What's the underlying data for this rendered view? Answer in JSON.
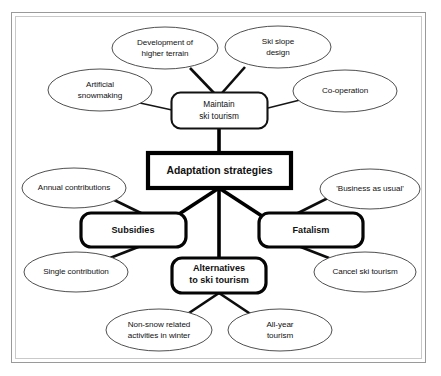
{
  "diagram": {
    "frame": {
      "border_color": "#9a9a9a",
      "inner_border_color": "#c9c9c9",
      "background": "#ffffff"
    },
    "center_node": {
      "id": "adaptation-strategies",
      "label": "Adaptation strategies",
      "shape": "rectangle",
      "border": "extra-thick",
      "bold": true
    },
    "branch_nodes": [
      {
        "id": "maintain-ski-tourism",
        "label_line1": "Maintain",
        "label_line2": "ski tourism",
        "shape": "rounded-rectangle",
        "border": "thin",
        "bold": false
      },
      {
        "id": "subsidies",
        "label_line1": "Subsidies",
        "label_line2": "",
        "shape": "rounded-rectangle",
        "border": "thick",
        "bold": true
      },
      {
        "id": "fatalism",
        "label_line1": "Fatalism",
        "label_line2": "",
        "shape": "rounded-rectangle",
        "border": "thick",
        "bold": true
      },
      {
        "id": "alternatives-to-ski-tourism",
        "label_line1": "Alternatives",
        "label_line2": "to ski tourism",
        "shape": "rounded-rectangle",
        "border": "thick",
        "bold": true
      }
    ],
    "leaf_nodes": [
      {
        "id": "development-of-higher-terrain",
        "label_line1": "Development of",
        "label_line2": "higher terrain",
        "parent": "maintain-ski-tourism",
        "shape": "ellipse"
      },
      {
        "id": "ski-slope-design",
        "label_line1": "Ski slope",
        "label_line2": "design",
        "parent": "maintain-ski-tourism",
        "shape": "ellipse"
      },
      {
        "id": "artificial-snowmaking",
        "label_line1": "Artificial",
        "label_line2": "snowmaking",
        "parent": "maintain-ski-tourism",
        "shape": "ellipse"
      },
      {
        "id": "co-operation",
        "label_line1": "Co-operation",
        "label_line2": "",
        "parent": "maintain-ski-tourism",
        "shape": "ellipse"
      },
      {
        "id": "annual-contributions",
        "label_line1": "Annual contributions",
        "label_line2": "",
        "parent": "subsidies",
        "shape": "ellipse"
      },
      {
        "id": "single-contribution",
        "label_line1": "Single contribution",
        "label_line2": "",
        "parent": "subsidies",
        "shape": "ellipse"
      },
      {
        "id": "business-as-usual",
        "label_line1": "'Business as usual'",
        "label_line2": "",
        "parent": "fatalism",
        "shape": "ellipse"
      },
      {
        "id": "cancel-ski-tourism",
        "label_line1": "Cancel ski tourism",
        "label_line2": "",
        "parent": "fatalism",
        "shape": "ellipse"
      },
      {
        "id": "non-snow-related-activities-in-winter",
        "label_line1": "Non-snow related",
        "label_line2": "activities in winter",
        "parent": "alternatives-to-ski-tourism",
        "shape": "ellipse"
      },
      {
        "id": "all-year-tourism",
        "label_line1": "All-year",
        "label_line2": "tourism",
        "parent": "alternatives-to-ski-tourism",
        "shape": "ellipse"
      }
    ]
  }
}
